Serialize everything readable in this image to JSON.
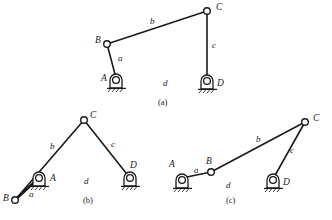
{
  "figure": {
    "background_color": "#ffffff",
    "line_color": "#1a1a1a"
  },
  "captions": [
    {
      "id": "cap-a",
      "text": "(a)",
      "x": 163,
      "y": 104
    },
    {
      "id": "cap-b",
      "text": "(b)",
      "x": 88,
      "y": 202
    },
    {
      "id": "cap-c",
      "text": "(c)",
      "x": 231,
      "y": 202
    }
  ],
  "diagrams": [
    {
      "id": "a",
      "caption": "(a)",
      "joints": [
        {
          "name": "B",
          "type": "pin",
          "x": 107,
          "y": 44,
          "label": "B",
          "label_x": 95,
          "label_y": 43
        },
        {
          "name": "C",
          "type": "pin",
          "x": 207,
          "y": 11,
          "label": "C",
          "label_x": 216,
          "label_y": 10
        },
        {
          "name": "A",
          "type": "ground-support",
          "x": 116,
          "y": 80,
          "label": "A",
          "label_x": 103,
          "label_y": 81
        },
        {
          "name": "D",
          "type": "ground-support",
          "x": 207,
          "y": 81,
          "label": "D",
          "label_x": 219,
          "label_y": 85
        }
      ],
      "links": [
        {
          "name": "a",
          "from": "A",
          "to": "B",
          "label": "a",
          "label_x": 118,
          "label_y": 60
        },
        {
          "name": "b",
          "from": "B",
          "to": "C",
          "label": "b",
          "label_x": 150,
          "label_y": 23
        },
        {
          "name": "c",
          "from": "C",
          "to": "D",
          "label": "c",
          "label_x": 213,
          "label_y": 47
        },
        {
          "name": "d",
          "from": "A",
          "to": "D",
          "label": "d",
          "label_x": 164,
          "label_y": 85,
          "fixed": true
        }
      ]
    },
    {
      "id": "b",
      "caption": "(b)",
      "joints": [
        {
          "name": "C",
          "type": "pin",
          "x": 84,
          "y": 120,
          "label": "C",
          "label_x": 92,
          "label_y": 118
        },
        {
          "name": "B",
          "type": "pin",
          "x": 15,
          "y": 200,
          "label": "B",
          "label_x": 5,
          "label_y": 200
        },
        {
          "name": "A",
          "type": "ground-support",
          "x": 39,
          "y": 178,
          "label": "A",
          "label_x": 52,
          "label_y": 180
        },
        {
          "name": "D",
          "type": "ground-support",
          "x": 130,
          "y": 178,
          "label": "D",
          "label_x": 132,
          "label_y": 167
        }
      ],
      "links": [
        {
          "name": "a",
          "from": "A",
          "to": "B",
          "label": "a",
          "label_x": 31,
          "label_y": 196
        },
        {
          "name": "b",
          "from": "B",
          "to": "C",
          "label": "b",
          "label_x": 52,
          "label_y": 148
        },
        {
          "name": "c",
          "from": "C",
          "to": "D",
          "label": "c",
          "label_x": 112,
          "label_y": 146
        },
        {
          "name": "d",
          "from": "A",
          "to": "D",
          "label": "d",
          "label_x": 85,
          "label_y": 183,
          "fixed": true
        }
      ]
    },
    {
      "id": "c",
      "caption": "(c)",
      "joints": [
        {
          "name": "B",
          "type": "pin",
          "x": 211,
          "y": 172,
          "label": "B",
          "label_x": 207,
          "label_y": 163
        },
        {
          "name": "C",
          "type": "pin",
          "x": 305,
          "y": 122,
          "label": "C",
          "label_x": 314,
          "label_y": 120
        },
        {
          "name": "A",
          "type": "ground-support",
          "x": 182,
          "y": 180,
          "label": "A",
          "label_x": 171,
          "label_y": 166
        },
        {
          "name": "D",
          "type": "ground-support",
          "x": 273,
          "y": 180,
          "label": "D",
          "label_x": 285,
          "label_y": 183
        }
      ],
      "links": [
        {
          "name": "a",
          "from": "A",
          "to": "B",
          "label": "a",
          "label_x": 196,
          "label_y": 172
        },
        {
          "name": "b",
          "from": "B",
          "to": "C",
          "label": "b",
          "label_x": 258,
          "label_y": 141
        },
        {
          "name": "c",
          "from": "C",
          "to": "D",
          "label": "c",
          "label_x": 291,
          "label_y": 152
        },
        {
          "name": "d",
          "from": "A",
          "to": "D",
          "label": "d",
          "label_x": 227,
          "label_y": 187,
          "fixed": true
        }
      ]
    }
  ]
}
